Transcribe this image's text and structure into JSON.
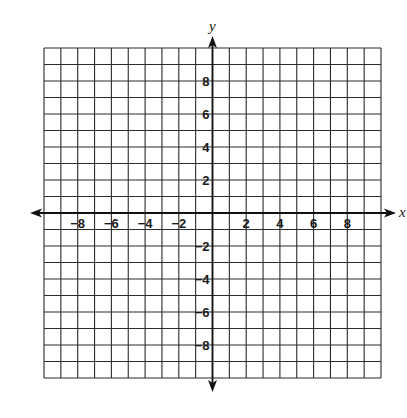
{
  "chart_data": {
    "type": "scatter",
    "title": "",
    "xlabel": "x",
    "ylabel": "y",
    "xlim": [
      -10,
      10
    ],
    "ylim": [
      -10,
      10
    ],
    "grid": true,
    "grid_step": 1,
    "x_ticks": [
      -8,
      -6,
      -4,
      -2,
      2,
      4,
      6,
      8
    ],
    "y_ticks": [
      8,
      6,
      4,
      2,
      -2,
      -4,
      -6,
      -8
    ],
    "x_tick_labels": [
      "−8",
      "−6",
      "−4",
      "−2",
      "2",
      "4",
      "6",
      "8"
    ],
    "y_tick_labels": [
      "8",
      "6",
      "4",
      "2",
      "−2",
      "−4",
      "−6",
      "−8"
    ],
    "series": [],
    "axes_arrows": true,
    "legend": null
  },
  "colors": {
    "grid": "#2b2b2b",
    "axis": "#111111",
    "background": "#ffffff",
    "text": "#1a1a1a"
  }
}
